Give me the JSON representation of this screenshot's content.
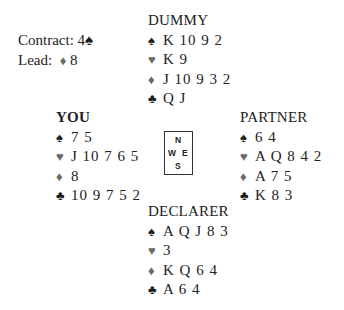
{
  "contract": {
    "label": "Contract:",
    "level": "4",
    "suit_symbol": "♠"
  },
  "lead": {
    "label": "Lead:",
    "suit_symbol": "♦",
    "card": "8"
  },
  "suit_symbols": {
    "spades": "♠",
    "hearts": "♥",
    "diamonds": "♦",
    "clubs": "♣"
  },
  "colors": {
    "black_suit": "#1a1a1a",
    "red_suit": "#6a6a6a",
    "text": "#222222"
  },
  "hands": {
    "dummy": {
      "title": "DUMMY",
      "spades": "K 10 9 2",
      "hearts": "K 9",
      "diamonds": "J 10 9 3 2",
      "clubs": "Q J"
    },
    "you": {
      "title": "YOU",
      "spades": "7 5",
      "hearts": "J 10 7 6 5",
      "diamonds": "8",
      "clubs": "10 9 7 5 2"
    },
    "partner": {
      "title": "PARTNER",
      "spades": "6 4",
      "hearts": "A Q 8 4 2",
      "diamonds": "A 7 5",
      "clubs": "K 8 3"
    },
    "declarer": {
      "title": "DECLARER",
      "spades": "A Q J 8 3",
      "hearts": "3",
      "diamonds": "K Q 6 4",
      "clubs": "A 6 4"
    }
  },
  "compass": {
    "n": "N",
    "w": "W",
    "e": "E",
    "s": "S"
  }
}
